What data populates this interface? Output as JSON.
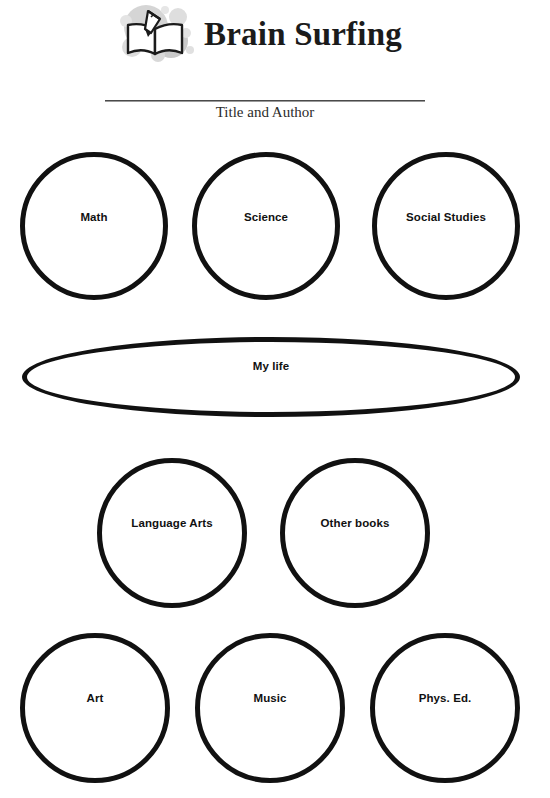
{
  "header": {
    "logo_icon": "open-book-with-pencil-icon",
    "title": "Brain Surfing"
  },
  "subtitle_section": {
    "label": "Title and Author",
    "rule_color": "#6a6a6a"
  },
  "worksheet": {
    "stroke_color": "#111111",
    "fill_color": "#ffffff",
    "rows": [
      {
        "name": "top-row",
        "shapes": [
          {
            "shape": "circle",
            "label": "Math"
          },
          {
            "shape": "circle",
            "label": "Science"
          },
          {
            "shape": "circle",
            "label": "Social Studies"
          }
        ]
      },
      {
        "name": "center-row",
        "shapes": [
          {
            "shape": "ellipse",
            "label": "My life"
          }
        ]
      },
      {
        "name": "middle-row",
        "shapes": [
          {
            "shape": "circle",
            "label": "Language Arts"
          },
          {
            "shape": "circle",
            "label": "Other books"
          }
        ]
      },
      {
        "name": "bottom-row",
        "shapes": [
          {
            "shape": "circle",
            "label": "Art"
          },
          {
            "shape": "circle",
            "label": "Music"
          },
          {
            "shape": "circle",
            "label": "Phys. Ed."
          }
        ]
      }
    ]
  }
}
